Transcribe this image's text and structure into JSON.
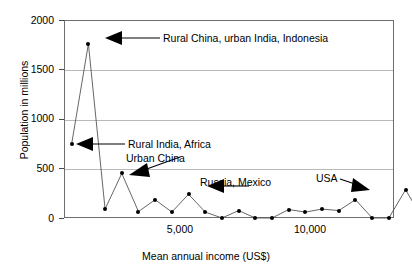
{
  "chart_data": {
    "type": "line",
    "title": "",
    "xlabel": "Mean annual income (US$)",
    "ylabel": "Population in millions",
    "xlim": [
      0,
      12850
    ],
    "ylim": [
      0,
      2000
    ],
    "grid": true,
    "legend_position": "none",
    "markers": true,
    "ytick_labels": [
      "0",
      "500",
      "1000",
      "1500",
      "2000"
    ],
    "ytick_values": [
      0,
      500,
      1000,
      1500,
      2000
    ],
    "xtick_labels": [
      "5,000",
      "10,000"
    ],
    "xtick_values": [
      5000,
      10000
    ],
    "series": [
      {
        "name": "Population by mean annual income",
        "points": [
          {
            "x": 300,
            "y": 750
          },
          {
            "x": 950,
            "y": 1760
          },
          {
            "x": 1600,
            "y": 90
          },
          {
            "x": 2250,
            "y": 450
          },
          {
            "x": 2900,
            "y": 65
          },
          {
            "x": 3550,
            "y": 185
          },
          {
            "x": 4200,
            "y": 60
          },
          {
            "x": 4850,
            "y": 240
          },
          {
            "x": 5500,
            "y": 60
          },
          {
            "x": 6150,
            "y": 0
          },
          {
            "x": 6800,
            "y": 75
          },
          {
            "x": 7450,
            "y": 0
          },
          {
            "x": 8100,
            "y": 0
          },
          {
            "x": 8750,
            "y": 85
          },
          {
            "x": 9400,
            "y": 60
          },
          {
            "x": 10050,
            "y": 90
          },
          {
            "x": 10700,
            "y": 75
          },
          {
            "x": 11350,
            "y": 185
          },
          {
            "x": 12000,
            "y": 0
          },
          {
            "x": 12650,
            "y": 0
          },
          {
            "x": 13300,
            "y": 285
          },
          {
            "x": 13950,
            "y": 0
          }
        ]
      }
    ],
    "annotations": [
      {
        "id": "rural-china-urban-india-indonesia",
        "text": "Rural China, urban India, Indonesia",
        "target_x": 950,
        "target_y": 1760
      },
      {
        "id": "rural-india-africa",
        "text": "Rural India, Africa",
        "target_x": 300,
        "target_y": 750
      },
      {
        "id": "urban-china",
        "text": "Urban China",
        "target_x": 2250,
        "target_y": 450
      },
      {
        "id": "russia-mexico",
        "text": "Russia, Mexico",
        "target_x": 4850,
        "target_y": 240
      },
      {
        "id": "usa",
        "text": "USA",
        "target_x": 13300,
        "target_y": 285
      }
    ]
  }
}
